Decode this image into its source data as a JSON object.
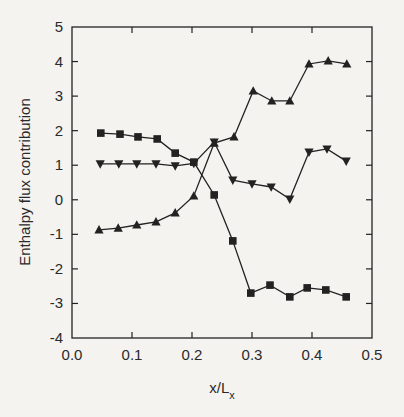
{
  "chart_data": {
    "type": "line",
    "title": "",
    "xlabel": "x/L",
    "xlabel_subscript": "x",
    "ylabel": "Enthalpy flux contribution",
    "xlim": [
      0.0,
      0.5
    ],
    "ylim": [
      -4,
      5
    ],
    "xticks": [
      0.0,
      0.1,
      0.2,
      0.3,
      0.4,
      0.5
    ],
    "xtick_labels": [
      "0.0",
      "0.1",
      "0.2",
      "0.3",
      "0.4",
      "0.5"
    ],
    "yticks": [
      -4,
      -3,
      -2,
      -1,
      0,
      1,
      2,
      3,
      4,
      5
    ],
    "ytick_labels": [
      "-4",
      "-3",
      "-2",
      "-1",
      "0",
      "1",
      "2",
      "3",
      "4",
      "5"
    ],
    "grid": false,
    "legend": null,
    "series": [
      {
        "name": "squares",
        "marker": "square",
        "x": [
          0.048,
          0.08,
          0.11,
          0.142,
          0.172,
          0.203,
          0.237,
          0.268,
          0.298,
          0.33,
          0.363,
          0.392,
          0.423,
          0.457
        ],
        "y": [
          1.93,
          1.9,
          1.82,
          1.76,
          1.35,
          1.09,
          0.14,
          -1.19,
          -2.7,
          -2.47,
          -2.81,
          -2.55,
          -2.61,
          -2.81
        ]
      },
      {
        "name": "down-triangles",
        "marker": "triangle-down",
        "x": [
          0.047,
          0.078,
          0.108,
          0.14,
          0.172,
          0.203,
          0.237,
          0.268,
          0.3,
          0.332,
          0.363,
          0.395,
          0.425,
          0.457
        ],
        "y": [
          1.04,
          1.04,
          1.04,
          1.04,
          0.98,
          1.05,
          1.67,
          0.57,
          0.46,
          0.37,
          0.02,
          1.38,
          1.47,
          1.12
        ]
      },
      {
        "name": "up-triangles",
        "marker": "triangle-up",
        "x": [
          0.045,
          0.077,
          0.108,
          0.14,
          0.172,
          0.203,
          0.237,
          0.27,
          0.302,
          0.333,
          0.363,
          0.395,
          0.427,
          0.458
        ],
        "y": [
          -0.87,
          -0.82,
          -0.73,
          -0.64,
          -0.38,
          0.11,
          1.64,
          1.82,
          3.15,
          2.86,
          2.86,
          3.93,
          4.02,
          3.93
        ]
      }
    ]
  },
  "style": {
    "ink": "#222222",
    "background": "#f4f3f0"
  }
}
